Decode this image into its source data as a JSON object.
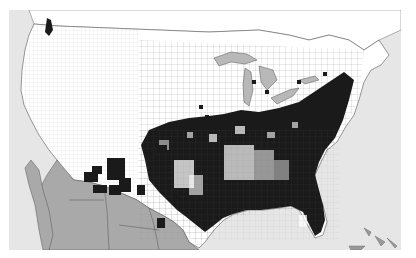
{
  "map": {
    "type": "county-level distribution map",
    "region": "United States (contiguous) with southern Canada and northern Mexico",
    "colors": {
      "ocean": "#e6e6e6",
      "land_unoccupied": "#ffffff",
      "county_present": "#1a1a1a",
      "foreign_land_mexico": "#a9a9a9",
      "lakes": "#b8b8b8",
      "borders": "#555555"
    },
    "legend": [],
    "labels": []
  }
}
